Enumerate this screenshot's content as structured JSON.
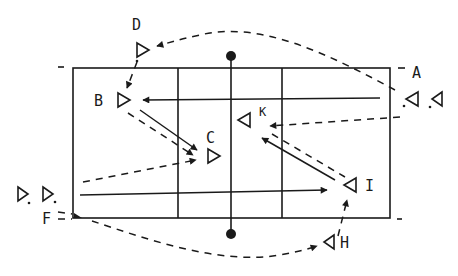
{
  "diagram": {
    "title": "",
    "court": {
      "left": 73,
      "top": 68,
      "right": 390,
      "bottom": 218,
      "net_x": 231
    },
    "ink_color": "#1a1a1a",
    "players": [
      {
        "id": "A",
        "label": "A",
        "x": 410,
        "y": 98
      },
      {
        "id": "A2",
        "label": "",
        "x": 438,
        "y": 98
      },
      {
        "id": "B",
        "label": "B",
        "x": 122,
        "y": 100
      },
      {
        "id": "C",
        "label": "C",
        "x": 212,
        "y": 156
      },
      {
        "id": "D",
        "label": "D",
        "x": 142,
        "y": 50
      },
      {
        "id": "E1",
        "label": "",
        "x": 22,
        "y": 195
      },
      {
        "id": "E2",
        "label": "",
        "x": 47,
        "y": 195
      },
      {
        "id": "F",
        "label": "F",
        "x": 45,
        "y": 218
      },
      {
        "id": "H",
        "label": "H",
        "x": 330,
        "y": 242
      },
      {
        "id": "I",
        "label": "I",
        "x": 352,
        "y": 185
      },
      {
        "id": "K",
        "label": "K",
        "x": 243,
        "y": 120
      }
    ],
    "labels": {
      "A": "A",
      "B": "B",
      "C": "C",
      "D": "D",
      "F": "F",
      "H": "H",
      "I": "I",
      "K": "K"
    }
  }
}
